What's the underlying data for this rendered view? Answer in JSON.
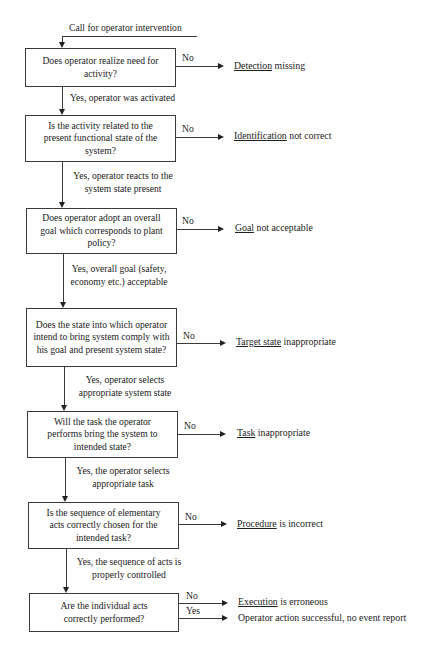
{
  "diagram": {
    "type": "flowchart",
    "start_label": "Call for operator intervention",
    "steps": [
      {
        "question": "Does operator realize need for activity?",
        "no_label": "No",
        "outcome_key": "Detection",
        "outcome_rest": " missing",
        "yes_label": "Yes, operator was activated"
      },
      {
        "question": "Is the activity related to the present functional state of the system?",
        "no_label": "No",
        "outcome_key": "Identification",
        "outcome_rest": " not correct",
        "yes_label": "Yes, operator reacts to the system state present"
      },
      {
        "question": "Does operator adopt an overall goal which corresponds to plant policy?",
        "no_label": "No",
        "outcome_key": "Goal",
        "outcome_rest": " not acceptable",
        "yes_label": "Yes, overall goal (safety, economy etc.) acceptable"
      },
      {
        "question": "Does the state into which operator intend to bring system comply with his goal and present system state?",
        "no_label": "No",
        "outcome_key": "Target state",
        "outcome_rest": " inappropriate",
        "yes_label": "Yes, operator selects appropriate system state"
      },
      {
        "question": "Will the task the operator performs bring the system to intended state?",
        "no_label": "No",
        "outcome_key": "Task",
        "outcome_rest": " inappropriate",
        "yes_label": "Yes, the operator selects appropriate task"
      },
      {
        "question": "Is the sequence of elementary acts correctly chosen for the intended task?",
        "no_label": "No",
        "outcome_key": "Procedure",
        "outcome_rest": " is incorrect",
        "yes_label": "Yes, the sequence of acts is properly controlled"
      },
      {
        "question": "Are the individual acts correctly performed?",
        "no_label": "No",
        "outcome_key": "Execution",
        "outcome_rest": " is erroneous",
        "yes_label": "Yes",
        "yes_outcome": "Operator action successful, no event report"
      }
    ]
  }
}
